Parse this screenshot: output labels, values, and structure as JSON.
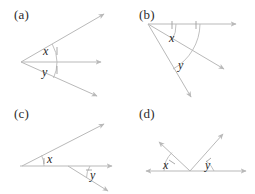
{
  "figure": {
    "width": 255,
    "height": 194,
    "background_color": "#ffffff",
    "line_color": "#b9b9b9",
    "text_color": "#1f1f1f"
  },
  "panels": [
    {
      "id": "a",
      "label": "(a)",
      "label_pos": {
        "x": 14,
        "y": 7
      },
      "vertex": {
        "x": 21,
        "y": 62
      },
      "rays": [
        {
          "name": "upper-ray",
          "to": {
            "x": 104,
            "y": 14
          }
        },
        {
          "name": "horizontal-ray",
          "to": {
            "x": 101,
            "y": 62
          }
        },
        {
          "name": "lower-ray",
          "to": {
            "x": 97,
            "y": 96
          }
        }
      ],
      "angles": [
        {
          "name": "x",
          "label": "x",
          "label_pos": {
            "x": 43,
            "y": 44
          },
          "arc_radius": 36,
          "ticks": 1
        },
        {
          "name": "y",
          "label": "y",
          "label_pos": {
            "x": 42,
            "y": 65
          },
          "arc_radius": 36,
          "ticks": 1
        }
      ]
    },
    {
      "id": "b",
      "label": "(b)",
      "label_pos": {
        "x": 139,
        "y": 7
      },
      "vertex": {
        "x": 148,
        "y": 24
      },
      "rays": [
        {
          "name": "horizontal-ray",
          "to": {
            "x": 236,
            "y": 24
          }
        },
        {
          "name": "middle-ray",
          "to": {
            "x": 224,
            "y": 69
          }
        },
        {
          "name": "steep-ray",
          "to": {
            "x": 191,
            "y": 97
          }
        }
      ],
      "angles": [
        {
          "name": "x",
          "label": "x",
          "label_pos": {
            "x": 169,
            "y": 31
          },
          "arc_radius": 28,
          "ticks": 1
        },
        {
          "name": "y",
          "label": "y",
          "label_pos": {
            "x": 178,
            "y": 58
          },
          "arc_radius": 52,
          "ticks": 1
        }
      ]
    },
    {
      "id": "c",
      "label": "(c)",
      "label_pos": {
        "x": 14,
        "y": 106
      },
      "vertex_left": {
        "x": 22,
        "y": 166
      },
      "vertex_right": {
        "x": 68,
        "y": 166
      },
      "rays": [
        {
          "name": "upper-ray",
          "to": {
            "x": 104,
            "y": 124
          }
        },
        {
          "name": "horizontal-ray",
          "to": {
            "x": 112,
            "y": 166
          }
        },
        {
          "name": "lower-ray",
          "to": {
            "x": 108,
            "y": 191
          }
        }
      ],
      "angles": [
        {
          "name": "x",
          "label": "x",
          "label_pos": {
            "x": 47,
            "y": 152
          },
          "arc_radius": 22,
          "ticks": 1
        },
        {
          "name": "y",
          "label": "y",
          "label_pos": {
            "x": 90,
            "y": 168
          },
          "arc_radius": 22,
          "ticks": 1
        }
      ]
    },
    {
      "id": "d",
      "label": "(d)",
      "label_pos": {
        "x": 139,
        "y": 106
      },
      "vertex": {
        "x": 190,
        "y": 171
      },
      "rays": [
        {
          "name": "baseline-left",
          "to": {
            "x": 146,
            "y": 171
          }
        },
        {
          "name": "baseline-right",
          "to": {
            "x": 246,
            "y": 171
          }
        },
        {
          "name": "left-ray",
          "to": {
            "x": 159,
            "y": 142
          }
        },
        {
          "name": "right-ray",
          "to": {
            "x": 223,
            "y": 134
          }
        }
      ],
      "angles": [
        {
          "name": "x",
          "label": "x",
          "label_pos": {
            "x": 163,
            "y": 158
          },
          "arc_radius": 26,
          "ticks": 1
        },
        {
          "name": "y",
          "label": "y",
          "label_pos": {
            "x": 205,
            "y": 158
          },
          "arc_radius": 24,
          "ticks": 1
        }
      ]
    }
  ]
}
